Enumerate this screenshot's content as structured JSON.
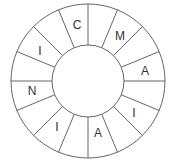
{
  "diagram": {
    "type": "letter-wheel",
    "center": [
      88,
      81
    ],
    "outer_radius": 77,
    "inner_radius": 36,
    "segment_count": 16,
    "line_color": "#555555",
    "segments": [
      {
        "angle_start": 90,
        "angle_end": 112.5,
        "letter": "C"
      },
      {
        "angle_start": 112.5,
        "angle_end": 135,
        "letter": ""
      },
      {
        "angle_start": 135,
        "angle_end": 157.5,
        "letter": "I"
      },
      {
        "angle_start": 157.5,
        "angle_end": 180,
        "letter": ""
      },
      {
        "angle_start": 180,
        "angle_end": 202.5,
        "letter": "N"
      },
      {
        "angle_start": 202.5,
        "angle_end": 225,
        "letter": ""
      },
      {
        "angle_start": 225,
        "angle_end": 247.5,
        "letter": "I"
      },
      {
        "angle_start": 247.5,
        "angle_end": 270,
        "letter": ""
      },
      {
        "angle_start": 270,
        "angle_end": 292.5,
        "letter": "A"
      },
      {
        "angle_start": 292.5,
        "angle_end": 315,
        "letter": ""
      },
      {
        "angle_start": 315,
        "angle_end": 337.5,
        "letter": "I"
      },
      {
        "angle_start": 337.5,
        "angle_end": 360,
        "letter": ""
      },
      {
        "angle_start": 0,
        "angle_end": 22.5,
        "letter": "A"
      },
      {
        "angle_start": 22.5,
        "angle_end": 45,
        "letter": ""
      },
      {
        "angle_start": 45,
        "angle_end": 67.5,
        "letter": "M"
      },
      {
        "angle_start": 67.5,
        "angle_end": 90,
        "letter": ""
      }
    ],
    "labels": [
      {
        "letter": "C",
        "x": 77,
        "y": 29
      },
      {
        "letter": "M",
        "x": 120,
        "y": 40
      },
      {
        "letter": "A",
        "x": 145,
        "y": 75
      },
      {
        "letter": "I",
        "x": 134,
        "y": 117
      },
      {
        "letter": "A",
        "x": 98,
        "y": 137
      },
      {
        "letter": "I",
        "x": 57,
        "y": 131
      },
      {
        "letter": "N",
        "x": 32,
        "y": 95
      },
      {
        "letter": "I",
        "x": 40,
        "y": 55
      }
    ]
  }
}
